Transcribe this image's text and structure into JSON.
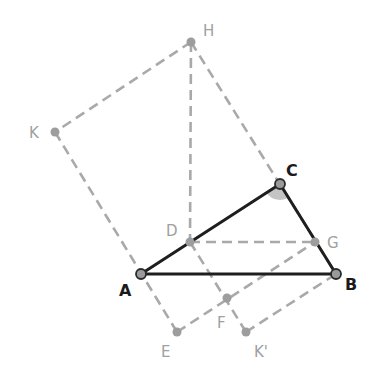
{
  "diagram": {
    "colors": {
      "triangle_edge": "#1e1e1e",
      "construction_line": "#a9a9a9",
      "main_label": "#1a1a1a",
      "aux_label": "#a0a0a0",
      "angle_fill": "#c4c4c4"
    },
    "points": {
      "A": {
        "label": "A",
        "x": 141,
        "y": 274,
        "lx": 119,
        "ly": 296
      },
      "B": {
        "label": "B",
        "x": 336,
        "y": 274,
        "lx": 345,
        "ly": 290
      },
      "C": {
        "label": "C",
        "x": 280,
        "y": 184,
        "lx": 286,
        "ly": 176
      },
      "D": {
        "label": "D",
        "x": 190,
        "y": 242,
        "lx": 166,
        "ly": 236
      },
      "G": {
        "label": "G",
        "x": 315,
        "y": 242,
        "lx": 327,
        "ly": 248
      },
      "H": {
        "label": "H",
        "x": 191,
        "y": 42,
        "lx": 203,
        "ly": 36
      },
      "K": {
        "label": "K",
        "x": 55,
        "y": 132,
        "lx": 29,
        "ly": 138
      },
      "E": {
        "label": "E",
        "x": 177,
        "y": 332,
        "lx": 161,
        "ly": 357
      },
      "F": {
        "label": "F",
        "x": 227,
        "y": 298,
        "lx": 217,
        "ly": 328
      },
      "Kp": {
        "label": "K'",
        "x": 246,
        "y": 332,
        "lx": 254,
        "ly": 357
      }
    },
    "triangle": [
      "A",
      "B",
      "C"
    ],
    "dashed_segments": [
      [
        "H",
        "K"
      ],
      [
        "K",
        "E"
      ],
      [
        "E",
        "G"
      ],
      [
        "H",
        "B"
      ],
      [
        "H",
        "D"
      ],
      [
        "D",
        "G"
      ],
      [
        "D",
        "Kp"
      ],
      [
        "Kp",
        "B"
      ]
    ],
    "angle_marker": {
      "vertex": "C",
      "radius": 16
    }
  }
}
